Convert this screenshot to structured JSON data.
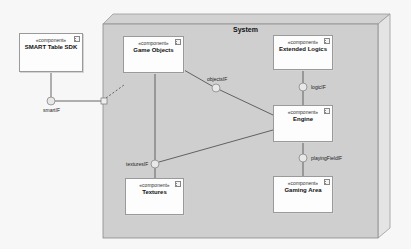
{
  "diagram": {
    "type": "UML component diagram",
    "system": {
      "title": "System"
    },
    "components": [
      {
        "id": "sdk",
        "stereotype": "«component»",
        "name": "SMART Table SDK"
      },
      {
        "id": "game_objects",
        "stereotype": "«component»",
        "name": "Game Objects"
      },
      {
        "id": "extended_logics",
        "stereotype": "«component»",
        "name": "Extended Logics"
      },
      {
        "id": "engine",
        "stereotype": "«component»",
        "name": "Engine"
      },
      {
        "id": "textures",
        "stereotype": "«component»",
        "name": "Textures"
      },
      {
        "id": "gaming_area",
        "stereotype": "«component»",
        "name": "Gaming Area"
      }
    ],
    "interfaces": [
      {
        "id": "smartIF",
        "label": "smartIF"
      },
      {
        "id": "objectsIF",
        "label": "objectsIF"
      },
      {
        "id": "logicIF",
        "label": "logicIF"
      },
      {
        "id": "playingFieldIF",
        "label": "playingFieldIF"
      },
      {
        "id": "texturesIF",
        "label": "texturesIF"
      }
    ],
    "connections": [
      {
        "from": "SMART Table SDK",
        "to": "smartIF"
      },
      {
        "from": "smartIF",
        "to": "System port"
      },
      {
        "from": "System port",
        "to": "Game Objects",
        "style": "dashed"
      },
      {
        "from": "Game Objects",
        "to": "objectsIF"
      },
      {
        "from": "objectsIF",
        "to": "Engine"
      },
      {
        "from": "Extended Logics",
        "to": "logicIF"
      },
      {
        "from": "logicIF",
        "to": "Engine"
      },
      {
        "from": "Engine",
        "to": "playingFieldIF"
      },
      {
        "from": "playingFieldIF",
        "to": "Gaming Area"
      },
      {
        "from": "Game Objects",
        "to": "texturesIF"
      },
      {
        "from": "Engine",
        "to": "texturesIF"
      },
      {
        "from": "texturesIF",
        "to": "Textures"
      }
    ]
  }
}
